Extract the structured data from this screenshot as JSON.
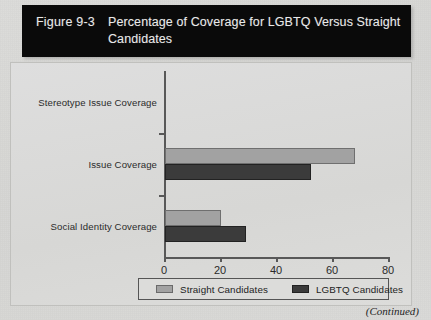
{
  "figure": {
    "number": "Figure 9-3",
    "title": "Percentage of Coverage for LGBTQ Versus Straight Candidates",
    "continued_note": "(Continued)"
  },
  "legend": {
    "position": "bottom",
    "entries": [
      {
        "label": "Straight Candidates",
        "color": "#a2a2a2",
        "swatch_icon": "legend-swatch-icon"
      },
      {
        "label": "LGBTQ Candidates",
        "color": "#3b3b3b",
        "swatch_icon": "legend-swatch-icon"
      }
    ]
  },
  "chart_data": {
    "type": "bar",
    "orientation": "horizontal",
    "title": "Percentage of Coverage for LGBTQ Versus Straight Candidates",
    "xlabel": "",
    "ylabel": "",
    "xlim": [
      0,
      80
    ],
    "xticks": [
      0,
      20,
      40,
      60,
      80
    ],
    "xtick_labels": [
      "0",
      "20",
      "40",
      "60",
      "80"
    ],
    "grid": false,
    "categories": [
      "Stereotype Issue Coverage",
      "Issue Coverage",
      "Social Identity Coverage"
    ],
    "series": [
      {
        "name": "Straight Candidates",
        "color": "#a2a2a2",
        "values": [
          0,
          68,
          20
        ]
      },
      {
        "name": "LGBTQ Candidates",
        "color": "#3b3b3b",
        "values": [
          0,
          52,
          29
        ]
      }
    ]
  }
}
